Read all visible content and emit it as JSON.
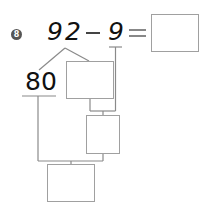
{
  "problem": {
    "number": "8",
    "minuend": "92",
    "operator": "−",
    "subtrahend": "9",
    "equals": "=",
    "answer": ""
  },
  "decomposition": {
    "split_tens": "80",
    "split_ones_box": "",
    "step_box": "",
    "final_box": ""
  }
}
